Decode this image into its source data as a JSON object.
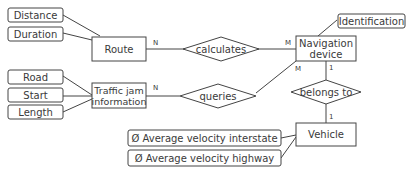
{
  "diagram": {
    "type": "entity-relationship",
    "entities": [
      {
        "id": "route",
        "label_lines": [
          "Route"
        ]
      },
      {
        "id": "traffic",
        "label_lines": [
          "Traffic jam",
          "information"
        ]
      },
      {
        "id": "nav",
        "label_lines": [
          "Navigation",
          "device"
        ]
      },
      {
        "id": "vehicle",
        "label_lines": [
          "Vehicle"
        ]
      }
    ],
    "relationships": [
      {
        "id": "calculates",
        "label": "calculates"
      },
      {
        "id": "queries",
        "label": "queries"
      },
      {
        "id": "belongs",
        "label": "belongs to"
      }
    ],
    "attributes": [
      {
        "id": "distance",
        "label": "Distance",
        "entity": "route"
      },
      {
        "id": "duration",
        "label": "Duration",
        "entity": "route"
      },
      {
        "id": "road",
        "label": "Road",
        "entity": "traffic"
      },
      {
        "id": "start",
        "label": "Start",
        "entity": "traffic"
      },
      {
        "id": "length",
        "label": "Length",
        "entity": "traffic"
      },
      {
        "id": "identification",
        "label": "Identification",
        "entity": "nav"
      },
      {
        "id": "avg_interstate",
        "label": "Ø Average velocity interstate",
        "entity": "vehicle"
      },
      {
        "id": "avg_highway",
        "label": "Ø Average velocity highway",
        "entity": "vehicle"
      }
    ],
    "cardinalities": {
      "route_calculates": "N",
      "nav_calculates": "M",
      "traffic_queries": "N",
      "nav_queries": "M",
      "nav_belongs": "1",
      "vehicle_belongs": "1"
    }
  }
}
